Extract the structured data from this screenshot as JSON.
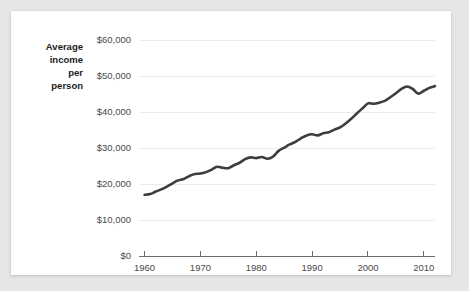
{
  "card": {
    "background": "#ffffff",
    "page_background": "#e6e6e6"
  },
  "chart_data": {
    "type": "line",
    "title": "",
    "xlabel": "",
    "ylabel": "Average income per person",
    "ylabel_lines": [
      "Average",
      "income",
      "per",
      "person"
    ],
    "line_color": "#3d3d3d",
    "grid": true,
    "grid_color": "#ececec",
    "legend": "none",
    "xlim": [
      1959,
      2012
    ],
    "ylim": [
      0,
      60000
    ],
    "xticks": [
      1960,
      1970,
      1980,
      1990,
      2000,
      2010
    ],
    "xtick_labels": [
      "1960",
      "1970",
      "1980",
      "1990",
      "2000",
      "2010"
    ],
    "yticks": [
      0,
      10000,
      20000,
      30000,
      40000,
      50000,
      60000
    ],
    "ytick_labels": [
      "$0",
      "$10,000",
      "$20,000",
      "$30,000",
      "$40,000",
      "$50,000",
      "$60,000"
    ],
    "x": [
      1960,
      1961,
      1962,
      1963,
      1964,
      1965,
      1966,
      1967,
      1968,
      1969,
      1970,
      1971,
      1972,
      1973,
      1974,
      1975,
      1976,
      1977,
      1978,
      1979,
      1980,
      1981,
      1982,
      1983,
      1984,
      1985,
      1986,
      1987,
      1988,
      1989,
      1990,
      1991,
      1992,
      1993,
      1994,
      1995,
      1996,
      1997,
      1998,
      1999,
      2000,
      2001,
      2002,
      2003,
      2004,
      2005,
      2006,
      2007,
      2008,
      2009,
      2010,
      2011,
      2012
    ],
    "values": [
      17000,
      17200,
      17900,
      18500,
      19300,
      20200,
      21000,
      21400,
      22200,
      22800,
      22900,
      23300,
      24000,
      24800,
      24500,
      24400,
      25200,
      25900,
      26900,
      27400,
      27200,
      27500,
      27000,
      27600,
      29200,
      30100,
      31000,
      31700,
      32700,
      33500,
      33800,
      33500,
      34100,
      34400,
      35100,
      35700,
      36800,
      38100,
      39600,
      41000,
      42400,
      42300,
      42600,
      43100,
      44100,
      45200,
      46400,
      47100,
      46400,
      45100,
      45900,
      46700,
      47200
    ],
    "y_value_prefix": "$",
    "start_value": 17000,
    "end_value": 47200,
    "peak_year": 2007,
    "peak_value": 47100
  }
}
